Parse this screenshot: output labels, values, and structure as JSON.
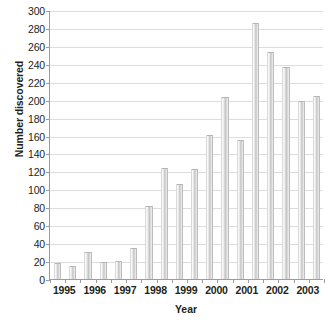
{
  "chart_data": {
    "type": "bar",
    "title": "",
    "xlabel": "Year",
    "ylabel": "Number discovered",
    "categories": [
      "1995",
      "1996",
      "1997",
      "1998",
      "1999",
      "2000",
      "2001",
      "2002",
      "2003"
    ],
    "bars": [
      {
        "category": "1995",
        "index": 0,
        "value": 18
      },
      {
        "category": "1995",
        "index": 1,
        "value": 15
      },
      {
        "category": "1996",
        "index": 0,
        "value": 30
      },
      {
        "category": "1996",
        "index": 1,
        "value": 19
      },
      {
        "category": "1997",
        "index": 0,
        "value": 20
      },
      {
        "category": "1997",
        "index": 1,
        "value": 35
      },
      {
        "category": "1998",
        "index": 0,
        "value": 81
      },
      {
        "category": "1998",
        "index": 1,
        "value": 124
      },
      {
        "category": "1999",
        "index": 0,
        "value": 106
      },
      {
        "category": "1999",
        "index": 1,
        "value": 123
      },
      {
        "category": "2000",
        "index": 0,
        "value": 161
      },
      {
        "category": "2000",
        "index": 1,
        "value": 203
      },
      {
        "category": "2001",
        "index": 0,
        "value": 155
      },
      {
        "category": "2001",
        "index": 1,
        "value": 285
      },
      {
        "category": "2002",
        "index": 0,
        "value": 253
      },
      {
        "category": "2002",
        "index": 1,
        "value": 236
      },
      {
        "category": "2003",
        "index": 0,
        "value": 199
      },
      {
        "category": "2003",
        "index": 1,
        "value": 204
      }
    ],
    "series": [
      {
        "name": "first-half",
        "values": [
          18,
          30,
          20,
          81,
          106,
          161,
          155,
          253,
          199
        ]
      },
      {
        "name": "second-half",
        "values": [
          15,
          19,
          35,
          124,
          123,
          203,
          285,
          236,
          204
        ]
      }
    ],
    "ylim": [
      0,
      300
    ],
    "ytick_step": 20,
    "yticks": [
      0,
      20,
      40,
      60,
      80,
      100,
      120,
      140,
      160,
      180,
      200,
      220,
      240,
      260,
      280,
      300
    ],
    "ytick_labels": [
      "0",
      "20",
      "40",
      "60",
      "80",
      "100",
      "120",
      "140",
      "160",
      "180",
      "200",
      "220",
      "240",
      "260",
      "280",
      "300"
    ],
    "grid": true,
    "legend": null,
    "colors": {
      "bar_fill": "#d2d2d2",
      "bar_highlight": "#fbfbfb",
      "bar_shadow": "#bdbdbd",
      "gridline": "#dcdcdc",
      "axis": "#9c9c9c",
      "text": "#231f20",
      "background": "#ffffff"
    }
  }
}
